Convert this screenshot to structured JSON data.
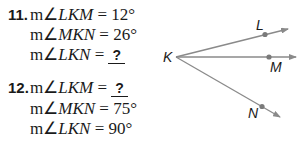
{
  "problems": [
    {
      "number": "11.",
      "lines": [
        {
          "prefix": "m∠",
          "angle": "LKM",
          "eq": " = ",
          "value": "12°",
          "unknown": false
        },
        {
          "prefix": "m∠",
          "angle": "MKN",
          "eq": " = ",
          "value": "26°",
          "unknown": false
        },
        {
          "prefix": "m∠",
          "angle": "LKN",
          "eq": " = ",
          "value": "?",
          "unknown": true
        }
      ]
    },
    {
      "number": "12.",
      "lines": [
        {
          "prefix": "m∠",
          "angle": "LKM",
          "eq": " = ",
          "value": "?",
          "unknown": true
        },
        {
          "prefix": "m∠",
          "angle": "MKN",
          "eq": " = ",
          "value": "75°",
          "unknown": false
        },
        {
          "prefix": "m∠",
          "angle": "LKN",
          "eq": " = ",
          "value": "90°",
          "unknown": false
        }
      ]
    }
  ],
  "figure": {
    "vertex_label": "K",
    "rays": [
      {
        "name": "L",
        "label": "L"
      },
      {
        "name": "M",
        "label": "M"
      },
      {
        "name": "N",
        "label": "N"
      }
    ],
    "ray_color": "#8a8a8a",
    "point_color": "#7a7a7a"
  }
}
